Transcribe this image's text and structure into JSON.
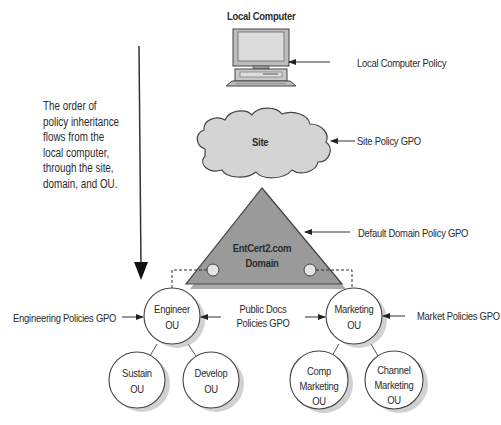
{
  "diagram": {
    "title": "Local Computer",
    "nodes": {
      "local_computer": {
        "label": "Local Computer"
      },
      "site": {
        "label": "Site"
      },
      "domain": {
        "line1": "EntCert2.com",
        "line2": "Domain"
      },
      "engineer": {
        "line1": "Engineer",
        "line2": "OU"
      },
      "marketing": {
        "line1": "Marketing",
        "line2": "OU"
      },
      "sustain": {
        "line1": "Sustain",
        "line2": "OU"
      },
      "develop": {
        "line1": "Develop",
        "line2": "OU"
      },
      "comp_marketing": {
        "line1": "Comp",
        "line2": "Marketing",
        "line3": "OU"
      },
      "channel_marketing": {
        "line1": "Channel",
        "line2": "Marketing",
        "line3": "OU"
      }
    },
    "policies": {
      "local": "Local Computer Policy",
      "site": "Site Policy GPO",
      "domain": "Default Domain Policy GPO",
      "engineering": "Engineering Policies GPO",
      "public_docs_line1": "Public Docs",
      "public_docs_line2": "Policies GPO",
      "market": "Market Policies GPO"
    },
    "note": {
      "lines": [
        "The order of",
        "policy inheritance",
        "flows from the",
        "local computer,",
        "through the site,",
        "domain, and OU."
      ]
    },
    "colors": {
      "shape_fill": "#d4d4d4",
      "triangle_fill": "#9a9a9a",
      "stroke": "#444444",
      "background": "#ffffff"
    }
  }
}
